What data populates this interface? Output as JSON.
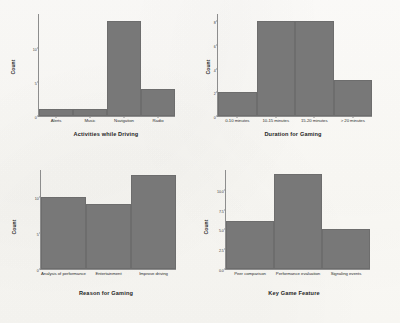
{
  "page": {
    "background_color": "#fbfaf7",
    "bar_color": "#787878",
    "axis_color": "#8d8d8d",
    "text_color": "#1f1f1f"
  },
  "ghost_artifacts": {
    "top_left_smudge": "",
    "bottom_strip": ""
  },
  "chart_data": [
    {
      "id": "activities-while-driving",
      "type": "bar",
      "title": "",
      "xlabel": "Activities while Driving",
      "ylabel": "Count",
      "categories": [
        "Alerts",
        "Music",
        "Navigation",
        "Radio"
      ],
      "values": [
        1,
        1,
        14,
        4
      ],
      "yticks": [
        "0",
        "5",
        "10"
      ],
      "ytick_values": [
        0,
        5,
        10
      ],
      "ylim": [
        0,
        15
      ],
      "grid": false,
      "legend": "none"
    },
    {
      "id": "duration-for-gaming",
      "type": "bar",
      "title": "",
      "xlabel": "Duration for Gaming",
      "ylabel": "Count",
      "categories": [
        "0-10 minutes",
        "10-15 minutes",
        "15-20 minutes",
        "> 20 minutes"
      ],
      "values": [
        2,
        8,
        8,
        3
      ],
      "yticks": [
        "0",
        "2",
        "4",
        "6",
        "8"
      ],
      "ytick_values": [
        0,
        2,
        4,
        6,
        8
      ],
      "ylim": [
        0,
        8.6
      ],
      "grid": false,
      "legend": "none"
    },
    {
      "id": "reason-for-gaming",
      "type": "bar",
      "title": "",
      "xlabel": "Reason for Gaming",
      "ylabel": "Count",
      "categories": [
        "Analysis of performance",
        "Entertainment",
        "Improve driving"
      ],
      "values": [
        10,
        9,
        13
      ],
      "yticks": [
        "0",
        "5",
        "10"
      ],
      "ytick_values": [
        0,
        5,
        10
      ],
      "ylim": [
        0,
        13.8
      ],
      "grid": false,
      "legend": "none"
    },
    {
      "id": "key-game-feature",
      "type": "bar",
      "title": "",
      "xlabel": "Key Game Feature",
      "ylabel": "Count",
      "categories": [
        "Peer comparison",
        "Performance evaluation",
        "Signaling events"
      ],
      "values": [
        6,
        12,
        5
      ],
      "yticks": [
        "0.0",
        "2.5",
        "5.0",
        "7.5",
        "10.0"
      ],
      "ytick_values": [
        0,
        2.5,
        5,
        7.5,
        10
      ],
      "ylim": [
        0,
        12.6
      ],
      "grid": false,
      "legend": "none"
    }
  ]
}
